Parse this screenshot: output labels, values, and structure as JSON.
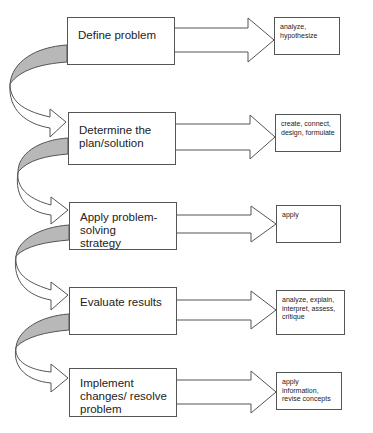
{
  "diagram": {
    "type": "problem-solving-process-flowchart",
    "colors": {
      "stroke": "#555555",
      "fill": "#ffffff",
      "curve_shade": "#b8b8b8"
    },
    "steps": [
      {
        "label": "Define problem",
        "outcomes": "analyze,\nhypothesize"
      },
      {
        "label": "Determine the plan/solution",
        "outcomes": "create, connect, design, formulate"
      },
      {
        "label": "Apply problem-solving strategy",
        "outcomes": "apply"
      },
      {
        "label": "Evaluate results",
        "outcomes": "analyze, explain, interpret, assess, critique"
      },
      {
        "label": "Implement changes/ resolve problem",
        "outcomes": "apply information, revise concepts"
      }
    ]
  }
}
